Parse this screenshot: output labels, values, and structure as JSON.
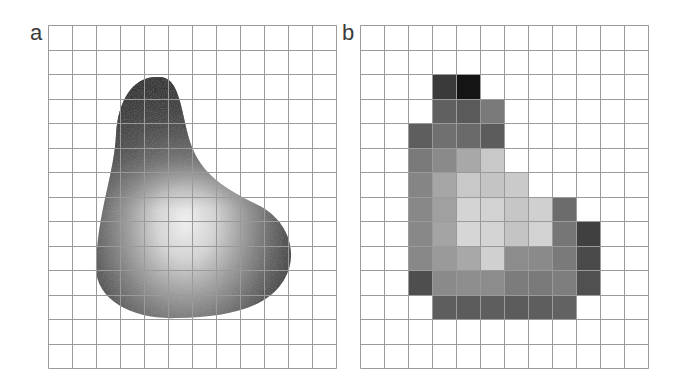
{
  "panels": [
    {
      "label": "a",
      "description": "continuous grayscale blob over grid",
      "grid": {
        "cols": 12,
        "rows": 14
      }
    },
    {
      "label": "b",
      "description": "pixelated (rasterized) version of blob",
      "grid": {
        "cols": 12,
        "rows": 14
      },
      "cells": [
        {
          "r": 2,
          "c": 3,
          "color": "#3a3a3a"
        },
        {
          "r": 2,
          "c": 4,
          "color": "#141414"
        },
        {
          "r": 3,
          "c": 3,
          "color": "#606060"
        },
        {
          "r": 3,
          "c": 4,
          "color": "#5a5a5a"
        },
        {
          "r": 3,
          "c": 5,
          "color": "#7a7a7a"
        },
        {
          "r": 4,
          "c": 2,
          "color": "#5e5e5e"
        },
        {
          "r": 4,
          "c": 3,
          "color": "#707070"
        },
        {
          "r": 4,
          "c": 4,
          "color": "#6a6a6a"
        },
        {
          "r": 4,
          "c": 5,
          "color": "#5c5c5c"
        },
        {
          "r": 5,
          "c": 2,
          "color": "#7a7a7a"
        },
        {
          "r": 5,
          "c": 3,
          "color": "#8a8a8a"
        },
        {
          "r": 5,
          "c": 4,
          "color": "#a8a8a8"
        },
        {
          "r": 5,
          "c": 5,
          "color": "#c8c8c8"
        },
        {
          "r": 6,
          "c": 2,
          "color": "#858585"
        },
        {
          "r": 6,
          "c": 3,
          "color": "#a6a6a6"
        },
        {
          "r": 6,
          "c": 4,
          "color": "#c8c8c8"
        },
        {
          "r": 6,
          "c": 5,
          "color": "#c4c4c4"
        },
        {
          "r": 6,
          "c": 6,
          "color": "#cacaca"
        },
        {
          "r": 7,
          "c": 2,
          "color": "#888888"
        },
        {
          "r": 7,
          "c": 3,
          "color": "#a0a0a0"
        },
        {
          "r": 7,
          "c": 4,
          "color": "#d4d4d4"
        },
        {
          "r": 7,
          "c": 5,
          "color": "#d2d2d2"
        },
        {
          "r": 7,
          "c": 6,
          "color": "#c6c6c6"
        },
        {
          "r": 7,
          "c": 7,
          "color": "#d0d0d0"
        },
        {
          "r": 7,
          "c": 8,
          "color": "#6c6c6c"
        },
        {
          "r": 8,
          "c": 2,
          "color": "#888888"
        },
        {
          "r": 8,
          "c": 3,
          "color": "#a4a4a4"
        },
        {
          "r": 8,
          "c": 4,
          "color": "#d6d6d6"
        },
        {
          "r": 8,
          "c": 5,
          "color": "#d4d4d4"
        },
        {
          "r": 8,
          "c": 6,
          "color": "#c4c4c4"
        },
        {
          "r": 8,
          "c": 7,
          "color": "#d2d2d2"
        },
        {
          "r": 8,
          "c": 8,
          "color": "#767676"
        },
        {
          "r": 8,
          "c": 9,
          "color": "#404040"
        },
        {
          "r": 9,
          "c": 2,
          "color": "#888888"
        },
        {
          "r": 9,
          "c": 3,
          "color": "#9a9a9a"
        },
        {
          "r": 9,
          "c": 4,
          "color": "#a8a8a8"
        },
        {
          "r": 9,
          "c": 5,
          "color": "#d0d0d0"
        },
        {
          "r": 9,
          "c": 6,
          "color": "#8c8c8c"
        },
        {
          "r": 9,
          "c": 7,
          "color": "#8a8a8a"
        },
        {
          "r": 9,
          "c": 8,
          "color": "#7a7a7a"
        },
        {
          "r": 9,
          "c": 9,
          "color": "#4a4a4a"
        },
        {
          "r": 10,
          "c": 2,
          "color": "#4e4e4e"
        },
        {
          "r": 10,
          "c": 3,
          "color": "#8a8a8a"
        },
        {
          "r": 10,
          "c": 4,
          "color": "#8e8e8e"
        },
        {
          "r": 10,
          "c": 5,
          "color": "#8c8c8c"
        },
        {
          "r": 10,
          "c": 6,
          "color": "#7c7c7c"
        },
        {
          "r": 10,
          "c": 7,
          "color": "#7a7a7a"
        },
        {
          "r": 10,
          "c": 8,
          "color": "#7e7e7e"
        },
        {
          "r": 10,
          "c": 9,
          "color": "#505050"
        },
        {
          "r": 11,
          "c": 3,
          "color": "#5e5e5e"
        },
        {
          "r": 11,
          "c": 4,
          "color": "#5c5c5c"
        },
        {
          "r": 11,
          "c": 5,
          "color": "#5e5e5e"
        },
        {
          "r": 11,
          "c": 6,
          "color": "#5c5c5c"
        },
        {
          "r": 11,
          "c": 7,
          "color": "#5e5e5e"
        },
        {
          "r": 11,
          "c": 8,
          "color": "#626262"
        }
      ]
    }
  ],
  "colors": {
    "grid_line": "#9a9a9a",
    "background": "#ffffff"
  }
}
